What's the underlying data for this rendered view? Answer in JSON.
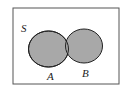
{
  "diagram": {
    "type": "venn",
    "universe_label": "S",
    "sets": [
      {
        "label": "A",
        "shaded": true
      },
      {
        "label": "B",
        "shaded": true
      }
    ],
    "colors": {
      "fill": "#a8a8a8",
      "stroke": "#222222",
      "frame": "#555555",
      "background": "#ffffff"
    }
  }
}
